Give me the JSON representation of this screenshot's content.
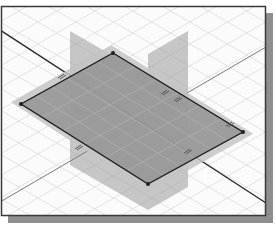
{
  "scene": {
    "title": "Isometric view of datum work planes",
    "canvas": {
      "width": 276,
      "height": 227
    },
    "frame": {
      "x": 1,
      "y": 6,
      "width": 265,
      "height": 210,
      "border_color": "#3a3a3a",
      "shadow_color": "#8e8e8e",
      "shadow_offset": 7,
      "background": "#fbfbfb"
    },
    "grid": {
      "color": "#e2e2e2",
      "spacing": 22
    },
    "colors": {
      "vertical_plane_fill": "#9a9a9a",
      "vertical_plane_opacity": 0.55,
      "horizontal_plane_fill": "#8c8c8c",
      "horizontal_plane_opacity": 0.75,
      "plane_halo": "#c4c4c4",
      "edge_dark": "#1e1e1e",
      "axis_line": "#2a2a2a",
      "axis_line_light": "#7a7a7a",
      "inner_grid": "#b3b3b3",
      "marker": "#555555"
    },
    "vertical_planes": [
      {
        "name": "xz-plane",
        "points": "70,31 148,76 148,210 70,165"
      },
      {
        "name": "yz-plane",
        "points": "188,31 148,54 148,210 188,187"
      }
    ],
    "horizontal_plane": {
      "name": "xy-plane",
      "corners": {
        "top": [
          113,
          53
        ],
        "right": [
          243,
          132
        ],
        "bottom": [
          148,
          184
        ],
        "left": [
          21,
          104
        ]
      }
    },
    "axes": [
      {
        "name": "x-axis",
        "x1": 0,
        "y1": 30,
        "x2": 266,
        "y2": 203,
        "style": "dark"
      },
      {
        "name": "y-axis",
        "x1": 266,
        "y1": 47,
        "x2": 0,
        "y2": 202,
        "style": "light"
      }
    ],
    "markers": [
      {
        "name": "constraint-glyph-left",
        "x": 62,
        "y": 76
      },
      {
        "name": "constraint-glyph-top-right",
        "x": 165,
        "y": 92
      },
      {
        "name": "constraint-glyph-parallel",
        "x": 178,
        "y": 99
      },
      {
        "name": "constraint-glyph-right",
        "x": 230,
        "y": 124
      },
      {
        "name": "constraint-glyph-bottom-left",
        "x": 79,
        "y": 147
      },
      {
        "name": "constraint-glyph-bottom-right",
        "x": 188,
        "y": 151
      }
    ]
  }
}
